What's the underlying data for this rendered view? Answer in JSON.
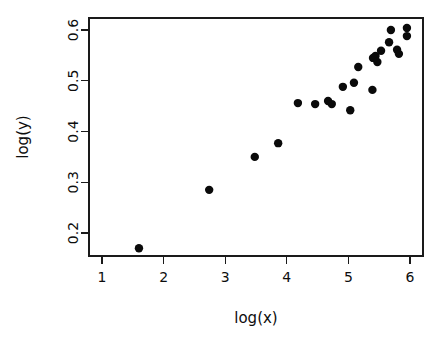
{
  "chart_data": {
    "type": "scatter",
    "title": "",
    "xlabel": "log(x)",
    "ylabel": "log(y)",
    "xlim": [
      1.23,
      6.21
    ],
    "ylim": [
      0.155,
      0.611
    ],
    "xticks": [
      1,
      2,
      3,
      4,
      5,
      6
    ],
    "xtick_labels": [
      "1",
      "2",
      "3",
      "4",
      "5",
      "6"
    ],
    "yticks": [
      0.2,
      0.3,
      0.4,
      0.5,
      0.6
    ],
    "ytick_labels": [
      "0.2",
      "0.3",
      "0.4",
      "0.5",
      "0.6"
    ],
    "grid": false,
    "legend": false,
    "point_color": "#0a0a0a",
    "point_shape": "filled-circle",
    "point_radius_px": 4.2,
    "box_border": true,
    "x": [
      1.6,
      2.74,
      3.48,
      3.86,
      4.18,
      4.46,
      4.67,
      4.73,
      4.91,
      5.03,
      5.09,
      5.16,
      5.39,
      5.4,
      5.44,
      5.47,
      5.53,
      5.66,
      5.69,
      5.79,
      5.82,
      5.95,
      5.95
    ],
    "y": [
      0.17,
      0.285,
      0.35,
      0.377,
      0.456,
      0.454,
      0.46,
      0.454,
      0.488,
      0.442,
      0.496,
      0.527,
      0.482,
      0.545,
      0.549,
      0.537,
      0.559,
      0.576,
      0.6,
      0.561,
      0.553,
      0.604,
      0.588
    ],
    "n_points": 23
  },
  "labels": {
    "x_axis_title": "log(x)",
    "y_axis_title": "log(y)"
  }
}
